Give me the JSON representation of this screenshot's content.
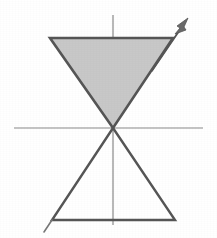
{
  "figure": {
    "background_color": "#ffffff",
    "width": 217,
    "height": 238,
    "stroke_color": "#555555",
    "axis_color": "#8a8a8a",
    "shade_color": "#c8c8c8",
    "origin": {
      "x": 113,
      "y": 128
    },
    "axes": {
      "horizontal": {
        "label": "horizontal-axis",
        "x1": 14,
        "y1": 128,
        "x2": 203,
        "y2": 128,
        "stroke_width": 1.2
      },
      "vertical": {
        "label": "vertical-axis",
        "x1": 113,
        "y1": 15,
        "x2": 113,
        "y2": 225,
        "stroke_width": 1.2
      }
    },
    "upper_triangle": {
      "label": "shaded upper triangle",
      "filled": "yes",
      "fill_color": "#c8c8c8",
      "points": "50,38 173,38 113,128",
      "stroke_width": 2.6
    },
    "lower_triangle": {
      "label": "unfilled lower triangle",
      "filled": "no",
      "fill_color": "#ffffff",
      "points": "113,128 52,220 175,220",
      "stroke_width": 2.4
    },
    "arrow": {
      "label": "direction arrow through upper-right vertex",
      "x1": 113,
      "y1": 128,
      "x2": 188,
      "y2": 18,
      "head_points": "188,18 177,26 180,28 175,34 186,30 184,27",
      "stroke_width": 1.8
    },
    "tail_stub": {
      "label": "line stub below lower-left vertex",
      "x1": 52,
      "y1": 220,
      "x2": 44,
      "y2": 232,
      "stroke_width": 1.6
    }
  }
}
